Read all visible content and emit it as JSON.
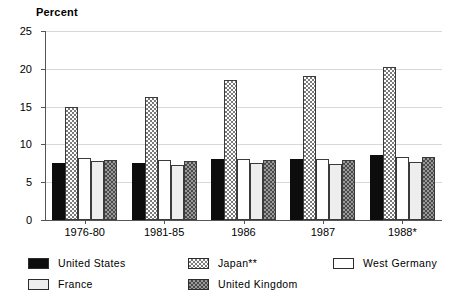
{
  "chart_data": {
    "type": "bar",
    "title": "",
    "subtitle": "",
    "xlabel": "",
    "ylabel": "Percent",
    "ylim": [
      0,
      25
    ],
    "yticks": [
      0,
      5,
      10,
      15,
      20,
      25
    ],
    "ytick_labels": [
      "0",
      "5",
      "10",
      "15",
      "20",
      "25"
    ],
    "grid": true,
    "grid_axis": "y",
    "legend_position": "bottom",
    "categories": [
      "1976-80",
      "1981-85",
      "1986",
      "1987",
      "1988*"
    ],
    "series": [
      {
        "name": "United States",
        "key": "us",
        "color": "#0d0d0d",
        "pattern": "solid-black",
        "values": [
          7.5,
          7.5,
          8.1,
          8.1,
          8.6
        ]
      },
      {
        "name": "Japan**",
        "key": "jp",
        "color": "#7a7a7a",
        "pattern": "light-crosshatch",
        "values": [
          15.0,
          16.3,
          18.5,
          19.1,
          20.3
        ]
      },
      {
        "name": "West Germany",
        "key": "wg",
        "color": "#ffffff",
        "pattern": "open-white",
        "values": [
          8.2,
          8.0,
          8.1,
          8.1,
          8.3
        ]
      },
      {
        "name": "France",
        "key": "fr",
        "color": "#eeeeee",
        "pattern": "very-light-gray",
        "values": [
          7.8,
          7.3,
          7.5,
          7.4,
          7.7
        ]
      },
      {
        "name": "United Kingdom",
        "key": "uk",
        "color": "#9a9a9a",
        "pattern": "dark-checkerboard",
        "values": [
          7.9,
          7.8,
          8.0,
          8.0,
          8.3
        ]
      }
    ]
  },
  "axis": {
    "y_title": "Percent",
    "y_tick_labels": [
      "25",
      "20",
      "15",
      "10",
      "5",
      "0"
    ],
    "x_tick_labels": [
      "1976-80",
      "1981-85",
      "1986",
      "1987",
      "1988*"
    ]
  },
  "legend": {
    "items": [
      {
        "label": "United States",
        "key": "us"
      },
      {
        "label": "France",
        "key": "fr"
      },
      {
        "label": "Japan**",
        "key": "jp"
      },
      {
        "label": "United Kingdom",
        "key": "uk"
      },
      {
        "label": "West Germany",
        "key": "wg"
      }
    ]
  }
}
